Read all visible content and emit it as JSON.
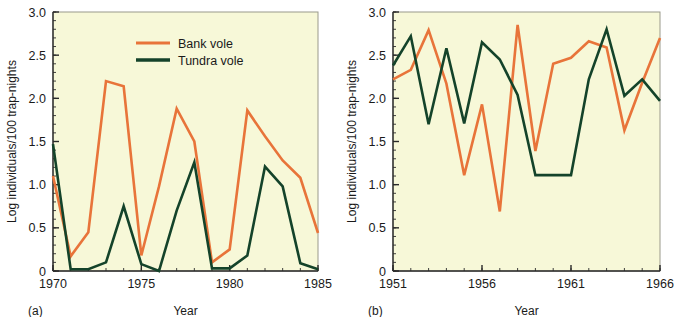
{
  "figure": {
    "background_color": "#ffffff",
    "plot_background_color": "#f7f8d8",
    "axis_color": "#2a2a2a"
  },
  "series_colors": {
    "bank_vole": "#e8743a",
    "tundra_vole": "#14432a"
  },
  "legend": {
    "position": "top-center-left",
    "entries": [
      {
        "label": "Bank vole",
        "color": "#e8743a"
      },
      {
        "label": "Tundra vole",
        "color": "#14432a"
      }
    ]
  },
  "panels": [
    {
      "id": "a",
      "panel_label": "(a)",
      "xlabel": "Year",
      "ylabel": "Log individuals/100 trap-nights"
    },
    {
      "id": "b",
      "panel_label": "(b)",
      "xlabel": "Year",
      "ylabel": "Log individuals/100 trap-nights"
    }
  ],
  "chart_data": [
    {
      "type": "line",
      "id": "a",
      "title": "",
      "panel_label": "(a)",
      "xlabel": "Year",
      "ylabel": "Log individuals/100 trap-nights",
      "xlim": [
        1970,
        1985
      ],
      "ylim": [
        0,
        3.0
      ],
      "xticks": [
        1970,
        1975,
        1980,
        1985
      ],
      "xtick_labels": [
        "1970",
        "1975",
        "1980",
        "1985"
      ],
      "xminor_step": 1,
      "yticks": [
        0,
        0.5,
        1.0,
        1.5,
        2.0,
        2.5,
        3.0
      ],
      "ytick_labels": [
        "0",
        "0.5",
        "1.0",
        "1.5",
        "2.0",
        "2.5",
        "3.0"
      ],
      "yminor_step": 0.1,
      "grid": false,
      "legend_position": "upper center",
      "x": [
        1970,
        1971,
        1972,
        1973,
        1974,
        1975,
        1976,
        1977,
        1978,
        1979,
        1980,
        1981,
        1982,
        1983,
        1984,
        1985
      ],
      "series": [
        {
          "name": "Bank vole",
          "color": "#e8743a",
          "values": [
            1.1,
            0.17,
            0.45,
            2.2,
            2.14,
            0.18,
            0.98,
            1.88,
            1.5,
            0.1,
            0.25,
            1.86,
            1.56,
            1.28,
            1.08,
            0.44
          ]
        },
        {
          "name": "Tundra vole",
          "color": "#14432a",
          "values": [
            1.47,
            0.02,
            0.02,
            0.1,
            0.75,
            0.08,
            0.0,
            0.7,
            1.26,
            0.03,
            0.03,
            0.18,
            1.21,
            0.98,
            0.09,
            0.02
          ]
        }
      ]
    },
    {
      "type": "line",
      "id": "b",
      "title": "",
      "panel_label": "(b)",
      "xlabel": "Year",
      "ylabel": "Log individuals/100 trap-nights",
      "xlim": [
        1951,
        1966
      ],
      "ylim": [
        0,
        3.0
      ],
      "xticks": [
        1951,
        1956,
        1961,
        1966
      ],
      "xtick_labels": [
        "1951",
        "1956",
        "1961",
        "1966"
      ],
      "xminor_step": 1,
      "yticks": [
        0,
        0.5,
        1.0,
        1.5,
        2.0,
        2.5,
        3.0
      ],
      "ytick_labels": [
        "0",
        "0.5",
        "1.0",
        "1.5",
        "2.0",
        "2.5",
        "3.0"
      ],
      "yminor_step": 0.1,
      "grid": false,
      "legend_position": "none",
      "x": [
        1951,
        1952,
        1953,
        1954,
        1955,
        1956,
        1957,
        1958,
        1959,
        1960,
        1961,
        1962,
        1963,
        1964,
        1965,
        1966
      ],
      "series": [
        {
          "name": "Bank vole",
          "color": "#e8743a",
          "values": [
            2.22,
            2.33,
            2.79,
            2.17,
            1.11,
            1.93,
            0.69,
            2.85,
            1.39,
            2.4,
            2.47,
            2.66,
            2.59,
            1.63,
            2.18,
            2.7
          ]
        },
        {
          "name": "Tundra vole",
          "color": "#14432a",
          "values": [
            2.38,
            2.72,
            1.7,
            2.58,
            1.71,
            2.65,
            2.45,
            2.04,
            1.11,
            1.11,
            1.11,
            2.22,
            2.8,
            2.03,
            2.22,
            1.97
          ]
        }
      ]
    }
  ]
}
